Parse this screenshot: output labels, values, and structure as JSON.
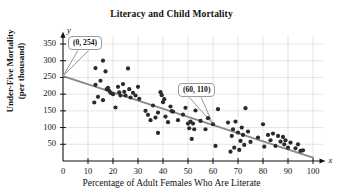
{
  "chart_data": {
    "type": "scatter",
    "title": "Literacy and Child Mortality",
    "xlabel": "Percentage of Adult Females Who Are Literate",
    "ylabel_line1": "Under-Five Mortality",
    "ylabel_line2": "(per thousand)",
    "axis_letter_x": "x",
    "axis_letter_y": "y",
    "xlim": [
      0,
      104
    ],
    "ylim": [
      0,
      375
    ],
    "xticks": [
      0,
      10,
      20,
      30,
      40,
      50,
      60,
      70,
      80,
      90,
      100
    ],
    "yticks": [
      50,
      100,
      150,
      200,
      250,
      300,
      350
    ],
    "grid": true,
    "grid_color": "#d4d4d4",
    "point_color": "#2b2b2b",
    "line_color": "#8a8a8a",
    "trendline": {
      "x1": 0,
      "y1": 254,
      "x2": 100,
      "y2": 10,
      "label": "y = 254 - 2.44x"
    },
    "annotations": [
      {
        "text": "(0, 254)",
        "point_x": 0,
        "point_y": 254,
        "box_x": 68,
        "box_y": 36
      },
      {
        "text": "(60, 110)",
        "point_x": 60,
        "point_y": 110,
        "box_x": 178,
        "box_y": 83
      }
    ],
    "points": [
      [
        13,
        228
      ],
      [
        12.5,
        175
      ],
      [
        13,
        278
      ],
      [
        14,
        192
      ],
      [
        15,
        240
      ],
      [
        16,
        300
      ],
      [
        16,
        182
      ],
      [
        17,
        268
      ],
      [
        17.5,
        215
      ],
      [
        18,
        219
      ],
      [
        18.5,
        210
      ],
      [
        19,
        204
      ],
      [
        20,
        200
      ],
      [
        21,
        160
      ],
      [
        22,
        222
      ],
      [
        22.5,
        205
      ],
      [
        23,
        196
      ],
      [
        24,
        230
      ],
      [
        24.5,
        207
      ],
      [
        25,
        196
      ],
      [
        26,
        277
      ],
      [
        26.5,
        215
      ],
      [
        27,
        190
      ],
      [
        28,
        204
      ],
      [
        29,
        196
      ],
      [
        30,
        222
      ],
      [
        30.5,
        186
      ],
      [
        33,
        150
      ],
      [
        34,
        138
      ],
      [
        35,
        122
      ],
      [
        36,
        166
      ],
      [
        37,
        130
      ],
      [
        38,
        145
      ],
      [
        38,
        84
      ],
      [
        39,
        206
      ],
      [
        39.5,
        197
      ],
      [
        40,
        176
      ],
      [
        40.5,
        185
      ],
      [
        41,
        133
      ],
      [
        42,
        116
      ],
      [
        43,
        163
      ],
      [
        43.5,
        149
      ],
      [
        44,
        148
      ],
      [
        46,
        122
      ],
      [
        48,
        139
      ],
      [
        49,
        159
      ],
      [
        50,
        112
      ],
      [
        50.5,
        98
      ],
      [
        51,
        118
      ],
      [
        51.5,
        66
      ],
      [
        52,
        112
      ],
      [
        52.5,
        95
      ],
      [
        53,
        151
      ],
      [
        55,
        120
      ],
      [
        57,
        95
      ],
      [
        58,
        128
      ],
      [
        60,
        110
      ],
      [
        61,
        45
      ],
      [
        62,
        155
      ],
      [
        66,
        115
      ],
      [
        67,
        28
      ],
      [
        67.5,
        75
      ],
      [
        68,
        95
      ],
      [
        68.5,
        40
      ],
      [
        69,
        118
      ],
      [
        70,
        85
      ],
      [
        70.5,
        33
      ],
      [
        71,
        60
      ],
      [
        71.5,
        100
      ],
      [
        72,
        78
      ],
      [
        72.5,
        48
      ],
      [
        73,
        158
      ],
      [
        74,
        88
      ],
      [
        75,
        57
      ],
      [
        78,
        70
      ],
      [
        80,
        110
      ],
      [
        80.5,
        43
      ],
      [
        82,
        78
      ],
      [
        83,
        62
      ],
      [
        84,
        82
      ],
      [
        85,
        45
      ],
      [
        86,
        75
      ],
      [
        87,
        58
      ],
      [
        88,
        72
      ],
      [
        88.5,
        50
      ],
      [
        89,
        62
      ],
      [
        90,
        40
      ],
      [
        91,
        55
      ],
      [
        93,
        38
      ],
      [
        94,
        50
      ],
      [
        95,
        30
      ],
      [
        96,
        32
      ]
    ]
  }
}
